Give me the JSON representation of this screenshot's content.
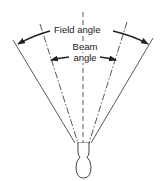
{
  "diagram": {
    "labels": {
      "field_angle": "Field angle",
      "beam_angle_line1": "Beam",
      "beam_angle_line2": "angle"
    },
    "elements": {
      "source": "lamp-bulb",
      "center_axis": "dashed-vertical",
      "field_edges": "solid-lines",
      "beam_edges": "dash-dot-lines"
    },
    "colors": {
      "line": "#333333",
      "background": "#ffffff"
    }
  }
}
